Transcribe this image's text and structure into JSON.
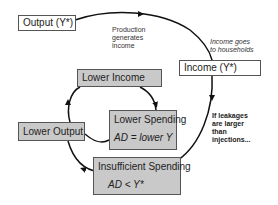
{
  "diagram": {
    "boxes": {
      "output": {
        "label": "Output (Y*)"
      },
      "income": {
        "label": "Income (Y*)"
      },
      "lower_income": {
        "label": "Lower Income"
      },
      "lower_output": {
        "label": "Lower Output"
      },
      "lower_spending": {
        "label": "Lower Spending",
        "equation": "AD =  lower Y"
      },
      "insufficient_spending": {
        "label": "Insufficient Spending",
        "equation": "AD < Y*"
      }
    },
    "annotations": {
      "production": [
        "Production",
        "generates",
        "income"
      ],
      "income_goes": [
        "Income goes",
        "to households"
      ],
      "leakages": [
        "If leakages",
        "are larger",
        "than",
        "injections..."
      ]
    },
    "colors": {
      "box_fill_gray": "#c9c9c9",
      "box_fill_white": "#ffffff",
      "arrow": "#111111"
    }
  }
}
